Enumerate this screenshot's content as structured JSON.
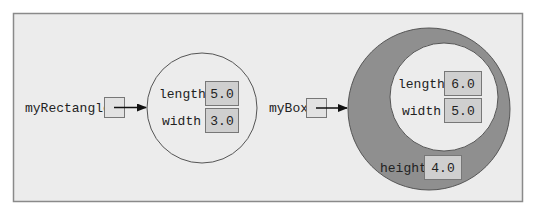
{
  "colors": {
    "frame_bg": "#ececec",
    "frame_border": "#8a8a8a",
    "circle_light": "#ececec",
    "circle_dark": "#8f8f8f",
    "value_box_fill": "#cfcfcf",
    "ref_box_fill": "#e2e2e2",
    "stroke": "#555555",
    "arrow": "#111111"
  },
  "rectangle": {
    "variable": "myRectangle",
    "fields": [
      {
        "name": "length",
        "value": "5.0"
      },
      {
        "name": "width",
        "value": "3.0"
      }
    ]
  },
  "box": {
    "variable": "myBox",
    "inherited_fields": [
      {
        "name": "length",
        "value": "6.0"
      },
      {
        "name": "width",
        "value": "5.0"
      }
    ],
    "own_fields": [
      {
        "name": "height",
        "value": "4.0"
      }
    ]
  }
}
